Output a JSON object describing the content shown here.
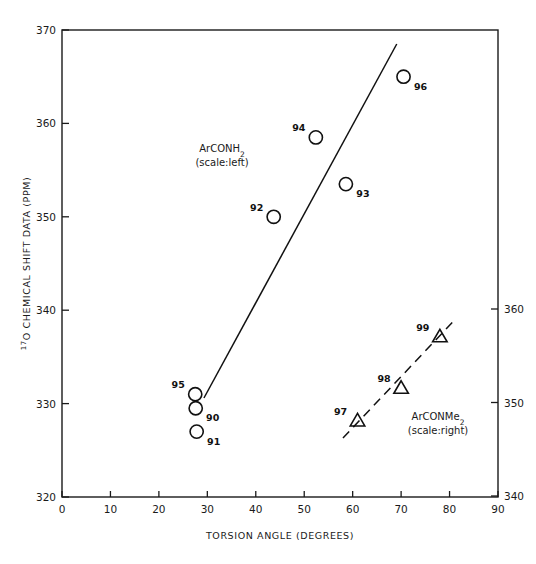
{
  "chart_data": {
    "type": "scatter",
    "title": "",
    "xlabel": "TORSION ANGLE (DEGREES)",
    "ylabel": "17O CHEMICAL SHIFT DATA (PPM)",
    "ylabel_sup": "17",
    "ylabel_rest": "O CHEMICAL SHIFT DATA (PPM)",
    "xlim": [
      0,
      90
    ],
    "xticks": [
      0,
      10,
      20,
      30,
      40,
      50,
      60,
      70,
      80,
      90
    ],
    "xtick_labels": [
      "0",
      "10",
      "20",
      "30",
      "40",
      "50",
      "60",
      "70",
      "80",
      "90"
    ],
    "ylim_left": [
      320,
      370
    ],
    "yticks_left": [
      320,
      330,
      340,
      350,
      360,
      370
    ],
    "ytick_labels_left": [
      "320",
      "330",
      "340",
      "350",
      "360",
      "370"
    ],
    "ylim_right": [
      340,
      365
    ],
    "yticks_right": [
      340,
      350,
      360
    ],
    "ytick_labels_right": [
      "340",
      "350",
      "360"
    ],
    "grid": false,
    "legend_position": "inline-annotations",
    "series": [
      {
        "name": "ArCONH2",
        "annotation": "ArCONH",
        "annotation_sub": "2",
        "scale_note": "(scale:left)",
        "axis": "left",
        "marker": "circle",
        "points": [
          {
            "label": "95",
            "x": 27.5,
            "y": 331.0,
            "label_pos": "left"
          },
          {
            "label": "90",
            "x": 27.6,
            "y": 329.5,
            "label_pos": "right"
          },
          {
            "label": "91",
            "x": 27.8,
            "y": 327.0,
            "label_pos": "right"
          },
          {
            "label": "92",
            "x": 43.7,
            "y": 350.0,
            "label_pos": "left"
          },
          {
            "label": "94",
            "x": 52.4,
            "y": 358.5,
            "label_pos": "left"
          },
          {
            "label": "93",
            "x": 58.6,
            "y": 353.5,
            "label_pos": "right"
          },
          {
            "label": "96",
            "x": 70.5,
            "y": 365.0,
            "label_pos": "right"
          }
        ],
        "trend_line": {
          "style": "solid",
          "x1": 29.3,
          "y1": 330.6,
          "x2": 69.1,
          "y2": 368.5
        }
      },
      {
        "name": "ArCONMe2",
        "annotation": "ArCONMe",
        "annotation_sub": "2",
        "scale_note": "(scale:right)",
        "axis": "right",
        "marker": "triangle",
        "points": [
          {
            "label": "97",
            "x": 61.0,
            "y": 348.0,
            "label_pos": "left"
          },
          {
            "label": "98",
            "x": 70.0,
            "y": 351.5,
            "label_pos": "left"
          },
          {
            "label": "99",
            "x": 78.0,
            "y": 357.0,
            "label_pos": "left"
          }
        ],
        "trend_line": {
          "style": "dashed",
          "x1": 58.0,
          "y1": 346.2,
          "x2": 81.0,
          "y2": 358.8
        }
      }
    ]
  }
}
